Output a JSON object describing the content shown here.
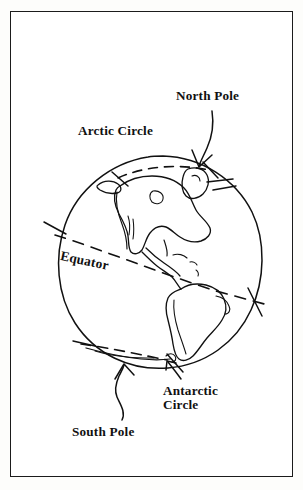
{
  "figure": {
    "background_color": "#ffffff",
    "ink_color": "#111111",
    "frame": {
      "border_color": "#1b1b1b"
    }
  },
  "labels": {
    "north_pole": "North Pole",
    "arctic_circle": "Arctic Circle",
    "equator": "Equator",
    "antarctic_circle_line1": "Antarctic",
    "antarctic_circle_line2": "Circle",
    "south_pole": "South Pole"
  },
  "diagram": {
    "globe_outline_name": "globe-circle",
    "continents": "Americas (North America, Central America, South America, Greenland, Caribbean islands)",
    "dashed_lines": [
      "arctic-circle-line",
      "equator-line",
      "antarctic-circle-line"
    ],
    "arrows": [
      "north-pole-arrow",
      "south-pole-arrow",
      "antarctic-circle-arrow"
    ],
    "tick_marks": [
      "arctic-circle-tick-left",
      "arctic-circle-tick-right",
      "equator-tick-left",
      "equator-tick-right",
      "antarctic-circle-tick-left",
      "antarctic-circle-tick-right"
    ]
  }
}
